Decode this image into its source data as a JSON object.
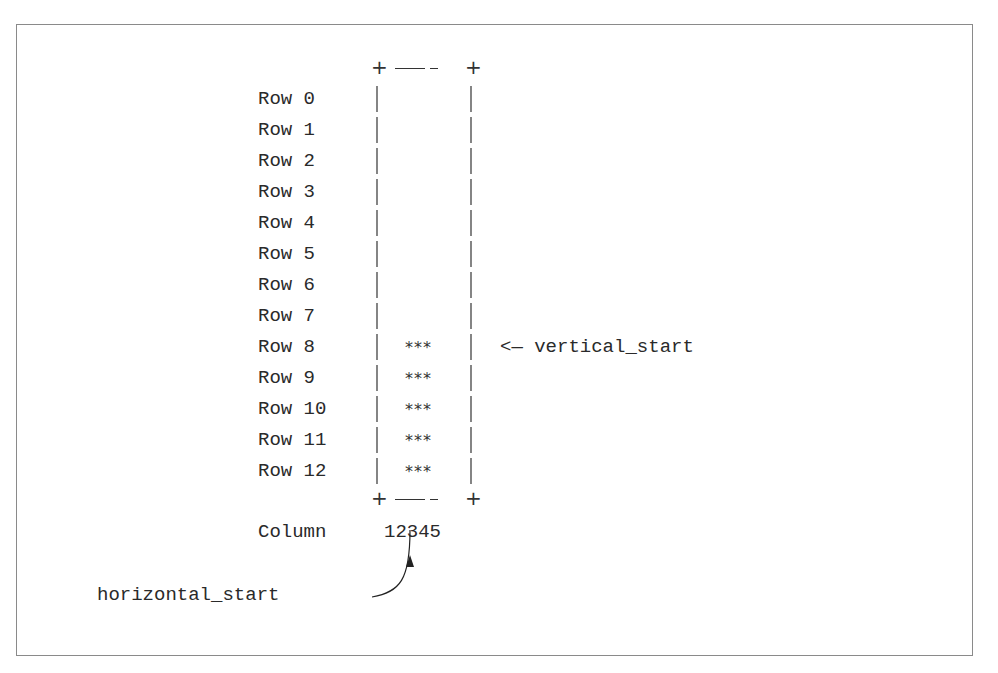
{
  "diagram": {
    "rows": [
      {
        "label": "Row 0",
        "content": ""
      },
      {
        "label": "Row 1",
        "content": ""
      },
      {
        "label": "Row 2",
        "content": ""
      },
      {
        "label": "Row 3",
        "content": ""
      },
      {
        "label": "Row 4",
        "content": ""
      },
      {
        "label": "Row 5",
        "content": ""
      },
      {
        "label": "Row 6",
        "content": ""
      },
      {
        "label": "Row 7",
        "content": ""
      },
      {
        "label": "Row 8",
        "content": "***"
      },
      {
        "label": "Row 9",
        "content": "***"
      },
      {
        "label": "Row 10",
        "content": "***"
      },
      {
        "label": "Row 11",
        "content": "***"
      },
      {
        "label": "Row 12",
        "content": "***"
      }
    ],
    "column_label": "Column",
    "column_numbers": "12345",
    "annotations": {
      "vertical_start": "<— vertical_start",
      "horizontal_start": "horizontal_start"
    }
  }
}
